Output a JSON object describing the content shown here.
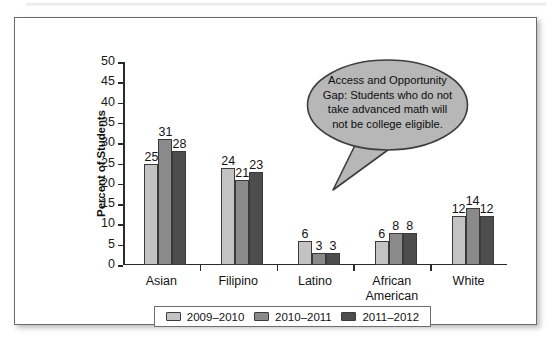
{
  "chart_data": {
    "type": "bar",
    "title": "",
    "xlabel": "",
    "ylabel": "Percent of Students",
    "ylim": [
      0,
      50
    ],
    "ytick_step": 5,
    "yticks": [
      50,
      45,
      40,
      35,
      30,
      25,
      20,
      15,
      10,
      5,
      0
    ],
    "grid": false,
    "legend_position": "bottom",
    "categories": [
      "Asian",
      "Filipino",
      "Latino",
      "African\nAmerican",
      "White"
    ],
    "series": [
      {
        "name": "2009–2010",
        "color": "#c3c3c3",
        "values": [
          25,
          24,
          6,
          6,
          12
        ]
      },
      {
        "name": "2010–2011",
        "color": "#8a8a8a",
        "values": [
          31,
          21,
          3,
          8,
          14
        ]
      },
      {
        "name": "2011–2012",
        "color": "#4d4d4d",
        "values": [
          28,
          23,
          3,
          8,
          12
        ]
      }
    ],
    "annotations": [
      {
        "name": "access-opportunity-gap-callout",
        "text": "Access and Opportunity Gap: Students who do not take advanced math will not be college eligible.",
        "fill": "#b7b7b7",
        "stroke": "#3d3d3d"
      }
    ]
  },
  "colors": {
    "frame_border": "#6b6b6b",
    "axis": "#2b2b2b",
    "text": "#141414",
    "series_1": "#c3c3c3",
    "series_2": "#8a8a8a",
    "series_3": "#4d4d4d",
    "callout_fill": "#b7b7b7"
  }
}
